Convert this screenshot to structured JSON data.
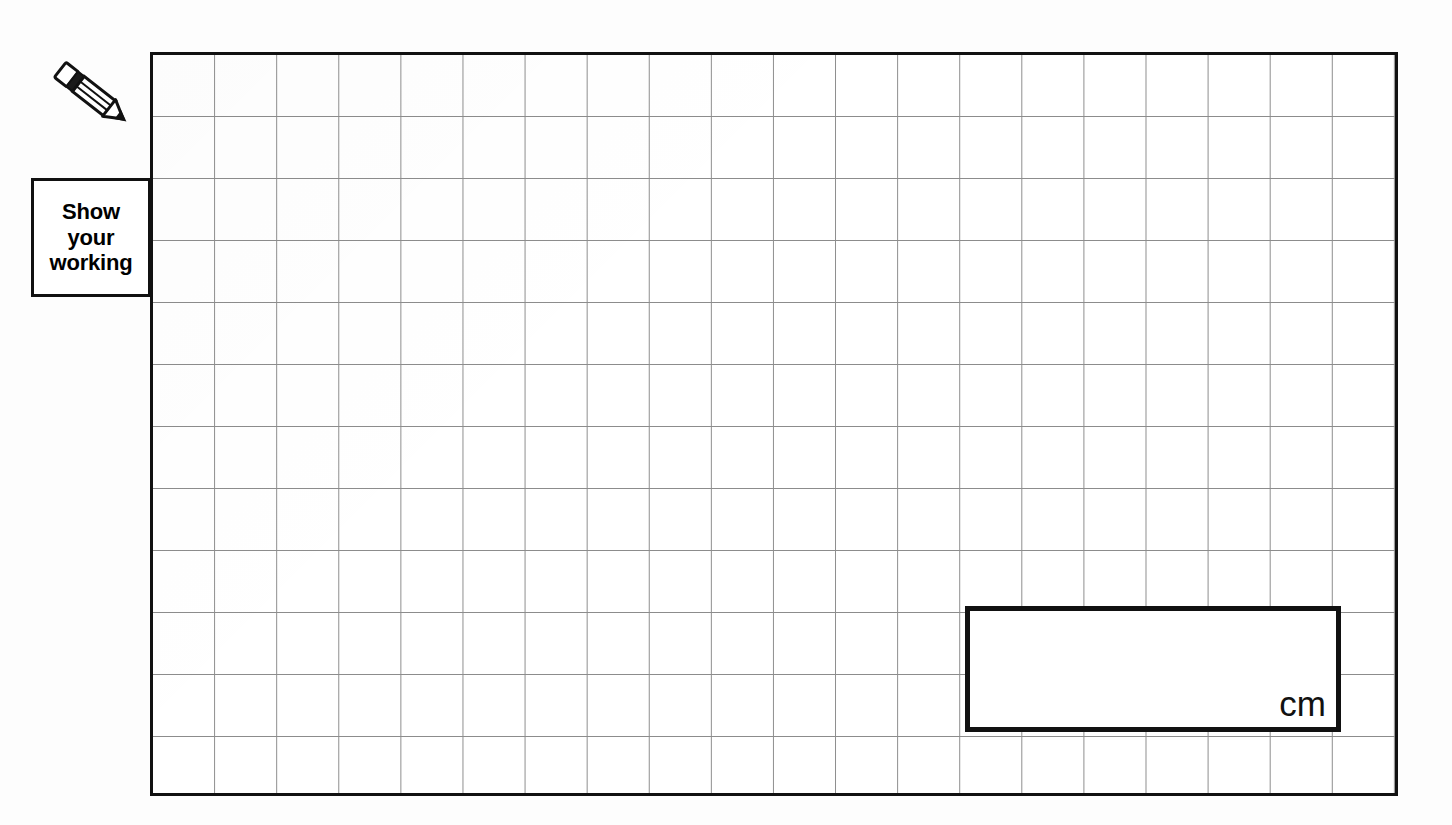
{
  "page": {
    "background_color": "#fdfdfd",
    "width": 1452,
    "height": 825
  },
  "grid": {
    "name": "squared-paper-grid",
    "columns": 20,
    "rows": 12,
    "cell_size_px": 62,
    "line_color": "#8c8c8c",
    "border_color": "#111111",
    "fill_color": "#ffffff"
  },
  "working_callout": {
    "line1": "Show",
    "line2": "your",
    "line3": "working",
    "border_color": "#111111",
    "text_color": "#000000"
  },
  "pencil": {
    "icon": "pencil-icon",
    "body_color": "#ffffff",
    "outline_color": "#111111",
    "ferrule_color": "#1a1a1a"
  },
  "answer_box": {
    "name": "answer-box",
    "unit_label": "cm",
    "value": "",
    "placeholder": "",
    "border_color": "#111111",
    "grid_columns_spanned": 6,
    "grid_rows_spanned": 2
  }
}
